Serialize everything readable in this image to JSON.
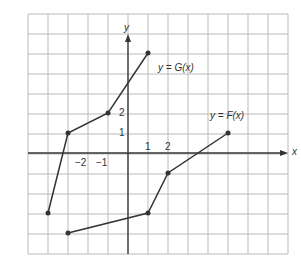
{
  "chart_data": {
    "type": "line",
    "title": "",
    "xlabel": "x",
    "ylabel": "y",
    "xlim": [
      -5,
      8
    ],
    "ylim": [
      -5,
      7
    ],
    "grid": true,
    "tick_labels_x": [
      "-2",
      "-1",
      "1",
      "2"
    ],
    "tick_labels_y": [
      "1",
      "2"
    ],
    "series": [
      {
        "name": "y = G(x)",
        "points": [
          [
            -4,
            -3
          ],
          [
            -3,
            1
          ],
          [
            -1,
            2
          ],
          [
            1,
            5
          ]
        ]
      },
      {
        "name": "y = F(x)",
        "points": [
          [
            -3,
            -4
          ],
          [
            1,
            -3
          ],
          [
            2,
            -1
          ],
          [
            5,
            1
          ]
        ]
      }
    ]
  },
  "labels": {
    "g": "y = G(x)",
    "f": "y = F(x)",
    "x": "x",
    "y": "y",
    "xm2": "−2",
    "xm1": "−1",
    "x1": "1",
    "x2": "2",
    "y1": "1",
    "y2": "2"
  }
}
